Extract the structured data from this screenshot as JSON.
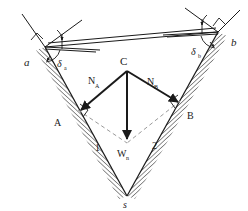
{
  "figure": {
    "type": "free-body-diagram",
    "background": "#ffffff",
    "line_color": "#1a1a1a",
    "dash_color": "#9a9a9a",
    "hatch_color": "#6e6e6e"
  },
  "labels": {
    "point_a_lower": "a",
    "point_b_lower": "b",
    "point_A_upper": "A",
    "point_B_upper": "B",
    "apex_C": "C",
    "bottom_s": "s",
    "plane_1": "1",
    "plane_2": "2",
    "force_NA": "N",
    "force_NA_sub": "A",
    "force_NB": "N",
    "force_NB_sub": "B",
    "force_Wn": "W",
    "force_Wn_sub": "n",
    "angle_delta_a": "δ",
    "angle_delta_a_sub": "a",
    "angle_delta_b": "δ",
    "angle_delta_b_sub": "b"
  },
  "geometry": {
    "left_vertex": [
      45,
      47
    ],
    "right_vertex": [
      218,
      32
    ],
    "bottom_vertex": [
      127,
      196
    ],
    "apex_C_point": [
      127,
      71
    ],
    "point_A": [
      76,
      113
    ],
    "point_B": [
      182,
      104
    ],
    "NA_tip": [
      80,
      110
    ],
    "NB_tip": [
      177,
      102
    ],
    "Wn_tip": [
      127,
      139
    ]
  },
  "angles": {
    "delta_a_value": "",
    "delta_b_value": ""
  }
}
